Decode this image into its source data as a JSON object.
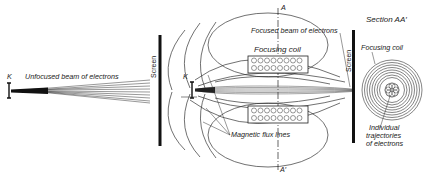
{
  "figure": {
    "left_panel": {
      "cathode_label": "K",
      "beam_label": "Unfocused beam of electrons",
      "screen_label": "Screen"
    },
    "middle_panel": {
      "cathode_label": "K",
      "section_top_label": "A",
      "section_bottom_label": "A′",
      "beam_label": "Focused beam of electrons",
      "coil_label": "Focusing coil",
      "flux_label": "Magnetic flux lines",
      "screen_label": "Screen"
    },
    "right_panel": {
      "title": "Section AA′",
      "coil_label": "Focusing coil",
      "trajectories_label_line1": "Individual",
      "trajectories_label_line2": "trajectories",
      "trajectories_label_line3": "of electrons"
    }
  }
}
